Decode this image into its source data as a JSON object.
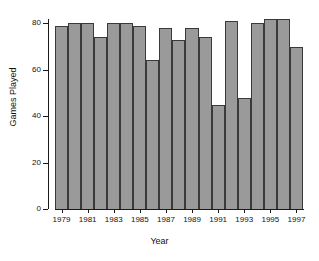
{
  "chart_data": {
    "type": "bar",
    "title": "",
    "xlabel": "Year",
    "ylabel": "Games Played",
    "categories": [
      "1979",
      "1980",
      "1981",
      "1982",
      "1983",
      "1984",
      "1985",
      "1986",
      "1987",
      "1988",
      "1989",
      "1990",
      "1991",
      "1992",
      "1993",
      "1994",
      "1995",
      "1996",
      "1997"
    ],
    "values": [
      79,
      80,
      80,
      74,
      80,
      80,
      79,
      64,
      78,
      73,
      78,
      74,
      45,
      81,
      48,
      80,
      82,
      82,
      70
    ],
    "xlim": [
      1978.5,
      1997.5
    ],
    "ylim": [
      0,
      84
    ],
    "yticks": [
      0,
      20,
      40,
      60,
      80
    ],
    "ytick_labels": [
      "0",
      "20",
      "40",
      "60",
      "80"
    ],
    "xticks": [
      1979,
      1981,
      1983,
      1985,
      1987,
      1989,
      1991,
      1993,
      1995,
      1997
    ],
    "xtick_labels": [
      "1979",
      "1981",
      "1983",
      "1985",
      "1987",
      "1989",
      "1991",
      "1993",
      "1995",
      "1997"
    ],
    "grid": false,
    "legend": "none",
    "bar_fill_color": "#9a9a9a",
    "bar_border_color": "#3a3a3a",
    "axis_color": "#1a1a1a",
    "background_color": "#ffffff"
  }
}
